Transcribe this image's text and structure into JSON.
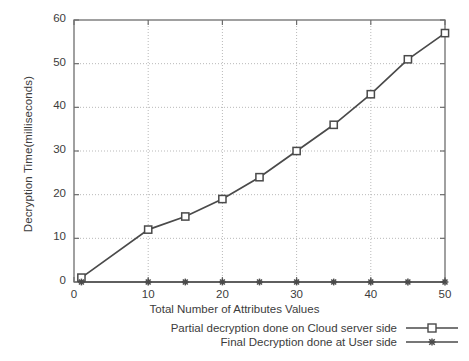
{
  "chart_data": {
    "type": "line",
    "title": "",
    "xlabel": "Total Number of Attributes Values",
    "ylabel": "Decryption Time(milliseconds)",
    "xlim": [
      0,
      50
    ],
    "ylim": [
      0,
      60
    ],
    "xticks": [
      0,
      10,
      20,
      30,
      40,
      50
    ],
    "yticks": [
      0,
      10,
      20,
      30,
      40,
      50,
      60
    ],
    "grid": true,
    "legend_position": "below-bottom-right",
    "x": [
      1,
      10,
      15,
      20,
      25,
      30,
      35,
      40,
      45,
      50
    ],
    "series": [
      {
        "name": "Partial decryption done on Cloud server side",
        "marker": "open-square",
        "color": "#4a4a4a",
        "values": [
          1,
          12,
          15,
          19,
          24,
          30,
          36,
          43,
          51,
          57
        ]
      },
      {
        "name": "Final Decryption done at User side",
        "marker": "asterisk",
        "color": "#4a4a4a",
        "values": [
          0,
          0,
          0,
          0,
          0,
          0,
          0,
          0,
          0,
          0
        ]
      }
    ]
  },
  "axis": {
    "y_tick_labels": [
      "0",
      "10",
      "20",
      "30",
      "40",
      "50",
      "60"
    ],
    "x_tick_labels": [
      "0",
      "10",
      "20",
      "30",
      "40",
      "50"
    ]
  },
  "legend": {
    "items": [
      {
        "label": "Partial decryption done on Cloud server side"
      },
      {
        "label": "Final Decryption done at User side"
      }
    ]
  },
  "colors": {
    "line": "#4a4a4a",
    "grid": "#b9b9b9",
    "border": "#6e6e6e",
    "text": "#3c3c3c",
    "background": "#ffffff"
  }
}
